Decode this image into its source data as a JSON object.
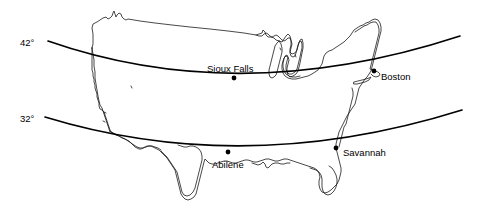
{
  "figure": {
    "kind": "map",
    "region": "contiguous-united-states",
    "background_color": "#ffffff",
    "outline_color": "#1a1a1a",
    "parallel_color": "#000000",
    "width": 485,
    "height": 213
  },
  "parallels": [
    {
      "id": "parallel-42",
      "label": "42°",
      "label_x": 20,
      "label_y": 38,
      "latitude": 42
    },
    {
      "id": "parallel-32",
      "label": "32°",
      "label_x": 20,
      "label_y": 114,
      "latitude": 32
    }
  ],
  "cities": [
    {
      "id": "sioux-falls",
      "name": "Sioux Falls",
      "dot_x": 234,
      "dot_y": 78,
      "label_x": 207,
      "label_y": 64
    },
    {
      "id": "boston",
      "name": "Boston",
      "dot_x": 374,
      "dot_y": 71,
      "label_x": 381,
      "label_y": 72
    },
    {
      "id": "abilene",
      "name": "Abilene",
      "dot_x": 228,
      "dot_y": 152,
      "label_x": 212,
      "label_y": 160
    },
    {
      "id": "savannah",
      "name": "Savannah",
      "dot_x": 336,
      "dot_y": 148,
      "label_x": 343,
      "label_y": 148
    }
  ]
}
